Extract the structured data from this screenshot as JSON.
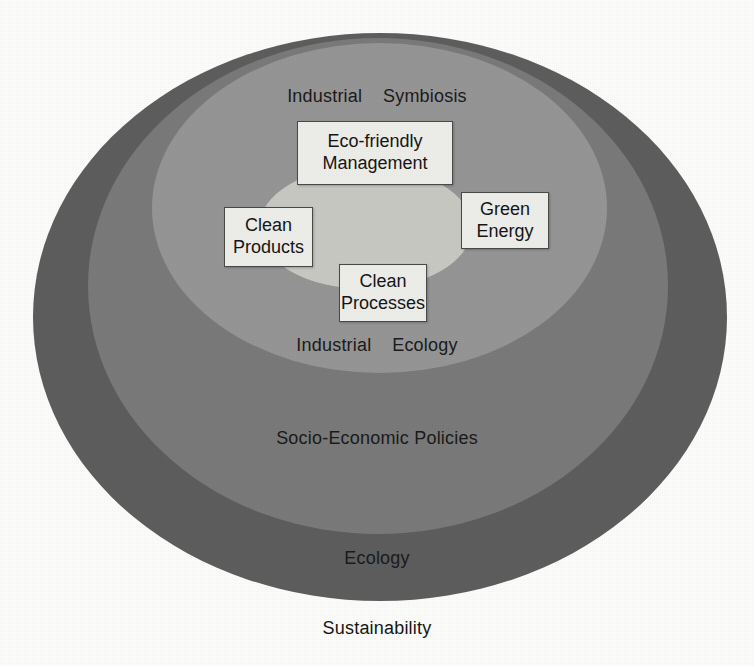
{
  "diagram": {
    "background_color": "#fdfdfb",
    "rings": [
      {
        "id": "ecology",
        "label": "Ecology",
        "color": "#5e5e5e",
        "level": 1
      },
      {
        "id": "socio_economic_policies",
        "label": "Socio-Economic Policies",
        "color": "#7a7a7a",
        "level": 2
      },
      {
        "id": "industrial_ecology",
        "label": "Industrial    Ecology",
        "color": "#969696",
        "level": 3
      },
      {
        "id": "industrial_symbiosis",
        "label": "Industrial    Symbiosis",
        "color": "#c9c9c4",
        "level": 4
      }
    ],
    "outer_label": "Sustainability",
    "nodes": [
      {
        "id": "eco_friendly_management",
        "label": "Eco-friendly\nManagement",
        "fill": "#eeeeea",
        "border": "#4a4a4a"
      },
      {
        "id": "clean_products",
        "label": "Clean\nProducts",
        "fill": "#eeeeea",
        "border": "#4a4a4a"
      },
      {
        "id": "green_energy",
        "label": "Green\nEnergy",
        "fill": "#eeeeea",
        "border": "#4a4a4a"
      },
      {
        "id": "clean_processes",
        "label": "Clean\nProcesses",
        "fill": "#eeeeea",
        "border": "#4a4a4a"
      }
    ]
  }
}
